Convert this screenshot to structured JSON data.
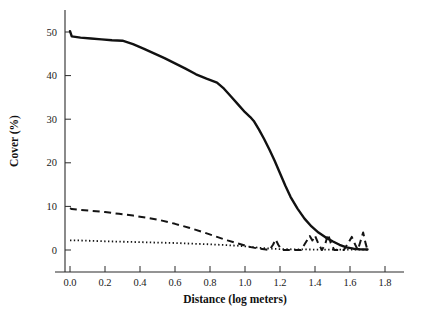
{
  "chart_data": {
    "type": "line",
    "title": "",
    "xlabel": "Distance (log meters)",
    "ylabel": "Cover (%)",
    "xlim": [
      -0.22,
      1.95
    ],
    "ylim": [
      -3.5,
      55
    ],
    "xticks": [
      "0.0",
      "0.2",
      "0.4",
      "0.6",
      "0.8",
      "1.0",
      "1.2",
      "1.4",
      "1.6",
      "1.8"
    ],
    "xtick_values": [
      0.0,
      0.2,
      0.4,
      0.6,
      0.8,
      1.0,
      1.2,
      1.4,
      1.6,
      1.8
    ],
    "yticks": [
      "0",
      "10",
      "20",
      "30",
      "40",
      "50"
    ],
    "ytick_values": [
      0,
      10,
      20,
      30,
      40,
      50
    ],
    "grid": false,
    "legend_position": "none",
    "series": [
      {
        "name": "solid-curve",
        "style": "solid",
        "color": "#111111",
        "x": [
          0.0,
          0.01,
          0.06,
          0.12,
          0.18,
          0.24,
          0.3,
          0.36,
          0.42,
          0.48,
          0.54,
          0.6,
          0.66,
          0.72,
          0.78,
          0.84,
          0.88,
          0.92,
          0.96,
          1.0,
          1.03,
          1.05,
          1.08,
          1.11,
          1.14,
          1.17,
          1.2,
          1.23,
          1.26,
          1.3,
          1.34,
          1.38,
          1.42,
          1.46,
          1.5,
          1.54,
          1.58,
          1.62,
          1.66,
          1.7
        ],
        "y": [
          50.2,
          49.0,
          48.7,
          48.5,
          48.3,
          48.1,
          48.0,
          47.2,
          46.2,
          45.1,
          44.0,
          42.8,
          41.6,
          40.3,
          39.3,
          38.4,
          37.0,
          35.2,
          33.4,
          31.6,
          30.5,
          29.6,
          27.6,
          25.4,
          23.0,
          20.4,
          17.6,
          14.8,
          12.2,
          9.5,
          7.2,
          5.4,
          4.0,
          2.9,
          2.0,
          1.2,
          0.6,
          0.3,
          0.15,
          0.1
        ]
      },
      {
        "name": "dashed-curve",
        "style": "dashed",
        "color": "#141414",
        "x": [
          0.0,
          0.01,
          0.06,
          0.12,
          0.2,
          0.28,
          0.36,
          0.44,
          0.52,
          0.6,
          0.68,
          0.76,
          0.84,
          0.9,
          0.95,
          1.0,
          1.04,
          1.08,
          1.12,
          1.14,
          1.16,
          1.175,
          1.19,
          1.21,
          1.24,
          1.28,
          1.32,
          1.345,
          1.37,
          1.385,
          1.4,
          1.42,
          1.44,
          1.46,
          1.475,
          1.49,
          1.51,
          1.54,
          1.565,
          1.59,
          1.61,
          1.63,
          1.645,
          1.66,
          1.675,
          1.69,
          1.7
        ],
        "y": [
          9.6,
          9.4,
          9.2,
          9.0,
          8.7,
          8.3,
          7.9,
          7.4,
          6.8,
          6.0,
          5.1,
          4.1,
          3.0,
          2.2,
          1.6,
          1.0,
          0.6,
          0.3,
          0.1,
          0.0,
          1.2,
          2.4,
          1.2,
          0.0,
          0.0,
          0.0,
          0.0,
          1.6,
          3.2,
          2.2,
          3.3,
          1.4,
          0.0,
          1.6,
          3.6,
          1.6,
          0.0,
          0.0,
          0.0,
          1.6,
          3.0,
          1.2,
          0.0,
          2.0,
          4.0,
          1.4,
          0.0
        ]
      },
      {
        "name": "dotted-curve",
        "style": "dotted",
        "color": "#141414",
        "x": [
          0.0,
          0.05,
          0.12,
          0.2,
          0.3,
          0.4,
          0.5,
          0.6,
          0.7,
          0.8,
          0.88,
          0.95,
          1.0,
          1.05,
          1.1,
          1.15,
          1.2,
          1.3,
          1.4,
          1.5,
          1.6,
          1.7
        ],
        "y": [
          2.2,
          2.2,
          2.1,
          2.0,
          1.9,
          1.8,
          1.7,
          1.6,
          1.45,
          1.3,
          1.15,
          1.0,
          0.85,
          0.65,
          0.45,
          0.3,
          0.2,
          0.15,
          0.1,
          0.1,
          0.1,
          0.1
        ]
      }
    ]
  },
  "figure": {
    "background_color": "#ffffff",
    "axis_color": "#2b2b2b"
  }
}
